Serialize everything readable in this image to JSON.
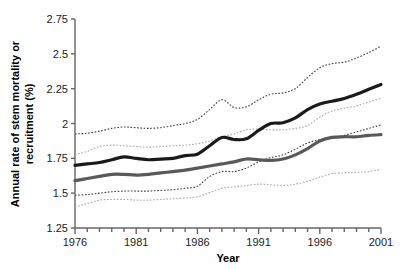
{
  "chart_data": {
    "type": "line",
    "title": "",
    "xlabel": "Year",
    "ylabel": "Annual rate of stem mortality or recruitment (%)",
    "ylabel_line1": "Annual rate of stem mortality or",
    "ylabel_line2": "recruitment (%)",
    "xlim": [
      1976,
      2001
    ],
    "ylim": [
      1.25,
      2.75
    ],
    "grid": false,
    "legend": "none",
    "xticks": [
      1976,
      1981,
      1986,
      1991,
      1996,
      2001
    ],
    "xtick_labels": [
      "1976",
      "1981",
      "1986",
      "1991",
      "1996",
      "2001"
    ],
    "xminor_step": 1,
    "yticks": [
      1.25,
      1.5,
      1.75,
      2,
      2.25,
      2.5,
      2.75
    ],
    "ytick_labels": [
      "1.25",
      "1.5",
      "1.75",
      "2",
      "2.25",
      "2.5",
      "2.75"
    ],
    "x": [
      1976,
      1977,
      1978,
      1979,
      1980,
      1981,
      1982,
      1983,
      1984,
      1985,
      1986,
      1987,
      1988,
      1989,
      1990,
      1991,
      1992,
      1993,
      1994,
      1995,
      1996,
      1997,
      1998,
      1999,
      2000,
      2001
    ],
    "series": [
      {
        "name": "Mortality",
        "style": "solid",
        "color": "#1a1a1a",
        "width": 3.2,
        "values": [
          1.7,
          1.71,
          1.72,
          1.74,
          1.76,
          1.75,
          1.74,
          1.745,
          1.75,
          1.77,
          1.78,
          1.84,
          1.9,
          1.885,
          1.89,
          1.95,
          2.0,
          2.005,
          2.04,
          2.1,
          2.14,
          2.16,
          2.18,
          2.21,
          2.245,
          2.28
        ]
      },
      {
        "name": "Mortality upper CI",
        "style": "dotted",
        "color": "#3c3c3c",
        "width": 1.1,
        "values": [
          1.925,
          1.93,
          1.945,
          1.965,
          1.975,
          1.97,
          1.965,
          1.97,
          1.985,
          2.0,
          2.03,
          2.1,
          2.17,
          2.115,
          2.12,
          2.17,
          2.21,
          2.22,
          2.25,
          2.33,
          2.4,
          2.43,
          2.44,
          2.47,
          2.51,
          2.555
        ]
      },
      {
        "name": "Mortality lower CI",
        "style": "dotted",
        "color": "#3c3c3c",
        "width": 1.1,
        "values": [
          1.485,
          1.49,
          1.5,
          1.51,
          1.515,
          1.515,
          1.515,
          1.52,
          1.525,
          1.535,
          1.55,
          1.62,
          1.655,
          1.655,
          1.68,
          1.725,
          1.755,
          1.775,
          1.815,
          1.86,
          1.885,
          1.9,
          1.915,
          1.94,
          1.965,
          1.99
        ]
      },
      {
        "name": "Recruitment",
        "style": "solid",
        "color": "#595959",
        "width": 3.2,
        "values": [
          1.59,
          1.605,
          1.62,
          1.635,
          1.635,
          1.63,
          1.635,
          1.645,
          1.655,
          1.665,
          1.68,
          1.695,
          1.71,
          1.725,
          1.745,
          1.74,
          1.735,
          1.745,
          1.775,
          1.82,
          1.875,
          1.9,
          1.905,
          1.905,
          1.915,
          1.92
        ]
      },
      {
        "name": "Recruitment upper CI",
        "style": "dotted",
        "color": "#a8a8a8",
        "width": 1.1,
        "values": [
          1.775,
          1.8,
          1.835,
          1.845,
          1.84,
          1.835,
          1.83,
          1.835,
          1.84,
          1.845,
          1.855,
          1.875,
          1.905,
          1.925,
          1.955,
          1.96,
          1.955,
          1.955,
          1.965,
          1.985,
          2.045,
          2.09,
          2.11,
          2.125,
          2.155,
          2.18
        ]
      },
      {
        "name": "Recruitment lower CI",
        "style": "dotted",
        "color": "#a8a8a8",
        "width": 1.1,
        "values": [
          1.4,
          1.425,
          1.45,
          1.455,
          1.455,
          1.45,
          1.45,
          1.455,
          1.46,
          1.465,
          1.475,
          1.505,
          1.535,
          1.545,
          1.555,
          1.565,
          1.56,
          1.555,
          1.565,
          1.585,
          1.615,
          1.64,
          1.645,
          1.65,
          1.655,
          1.67
        ]
      }
    ]
  },
  "axes": {
    "axis_color": "#666666"
  }
}
